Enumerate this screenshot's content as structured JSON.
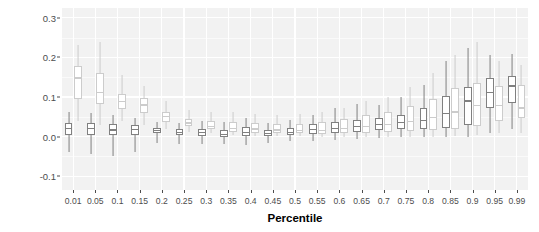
{
  "chart_data": {
    "type": "box",
    "title": "",
    "xlabel": "Percentile",
    "ylabel": "Pseudo R-Square",
    "ylim": [
      -0.135,
      0.325
    ],
    "yticks": [
      -0.1,
      0.0,
      0.1,
      0.2,
      0.3
    ],
    "ytick_labels": [
      "-0.1",
      "0.0",
      "0.1",
      "0.2",
      "0.3"
    ],
    "grid": true,
    "legend": "none",
    "categories": [
      "0.01",
      "0.05",
      "0.1",
      "0.15",
      "0.2",
      "0.25",
      "0.3",
      "0.35",
      "0.4",
      "0.45",
      "0.5",
      "0.55",
      "0.6",
      "0.65",
      "0.7",
      "0.75",
      "0.8",
      "0.85",
      "0.9",
      "0.95",
      "0.99"
    ],
    "series": [
      {
        "name": "group-a",
        "color_fill": "#ffffff",
        "color_line": "#808080",
        "boxes": [
          {
            "category": "0.01",
            "min": -0.04,
            "q1": 0.005,
            "median": 0.02,
            "q3": 0.035,
            "max": 0.063
          },
          {
            "category": "0.05",
            "min": -0.045,
            "q1": 0.004,
            "median": 0.02,
            "q3": 0.034,
            "max": 0.06
          },
          {
            "category": "0.1",
            "min": -0.048,
            "q1": 0.003,
            "median": 0.017,
            "q3": 0.031,
            "max": 0.055
          },
          {
            "category": "0.15",
            "min": -0.04,
            "q1": 0.004,
            "median": 0.018,
            "q3": 0.03,
            "max": 0.048
          },
          {
            "category": "0.2",
            "min": -0.015,
            "q1": 0.008,
            "median": 0.015,
            "q3": 0.021,
            "max": 0.038
          },
          {
            "category": "0.25",
            "min": -0.02,
            "q1": 0.004,
            "median": 0.01,
            "q3": 0.018,
            "max": 0.035
          },
          {
            "category": "0.3",
            "min": -0.018,
            "q1": 0.002,
            "median": 0.01,
            "q3": 0.02,
            "max": 0.04
          },
          {
            "category": "0.35",
            "min": -0.02,
            "q1": 0.0,
            "median": 0.006,
            "q3": 0.017,
            "max": 0.037
          },
          {
            "category": "0.4",
            "min": -0.022,
            "q1": 0.002,
            "median": 0.011,
            "q3": 0.024,
            "max": 0.048
          },
          {
            "category": "0.45",
            "min": -0.015,
            "q1": 0.002,
            "median": 0.008,
            "q3": 0.016,
            "max": 0.035
          },
          {
            "category": "0.5",
            "min": -0.012,
            "q1": 0.003,
            "median": 0.011,
            "q3": 0.022,
            "max": 0.043
          },
          {
            "category": "0.55",
            "min": -0.01,
            "q1": 0.006,
            "median": 0.018,
            "q3": 0.031,
            "max": 0.055
          },
          {
            "category": "0.6",
            "min": -0.008,
            "q1": 0.008,
            "median": 0.02,
            "q3": 0.038,
            "max": 0.072
          },
          {
            "category": "0.65",
            "min": -0.006,
            "q1": 0.011,
            "median": 0.026,
            "q3": 0.042,
            "max": 0.082
          },
          {
            "category": "0.7",
            "min": -0.003,
            "q1": 0.016,
            "median": 0.031,
            "q3": 0.046,
            "max": 0.08
          },
          {
            "category": "0.75",
            "min": -0.002,
            "q1": 0.018,
            "median": 0.035,
            "q3": 0.055,
            "max": 0.1
          },
          {
            "category": "0.8",
            "min": 0.0,
            "q1": 0.02,
            "median": 0.04,
            "q3": 0.072,
            "max": 0.13
          },
          {
            "category": "0.85",
            "min": 0.0,
            "q1": 0.022,
            "median": 0.058,
            "q3": 0.102,
            "max": 0.19
          },
          {
            "category": "0.9",
            "min": 0.0,
            "q1": 0.03,
            "median": 0.09,
            "q3": 0.125,
            "max": 0.225
          },
          {
            "category": "0.95",
            "min": 0.01,
            "q1": 0.072,
            "median": 0.112,
            "q3": 0.148,
            "max": 0.205
          },
          {
            "category": "0.99",
            "min": 0.02,
            "q1": 0.085,
            "median": 0.128,
            "q3": 0.152,
            "max": 0.208
          }
        ]
      },
      {
        "name": "group-b",
        "color_fill": "#ffffff",
        "color_line": "#cccccc",
        "boxes": [
          {
            "category": "0.01",
            "min": 0.04,
            "q1": 0.095,
            "median": 0.148,
            "q3": 0.178,
            "max": 0.232
          },
          {
            "category": "0.05",
            "min": 0.03,
            "q1": 0.082,
            "median": 0.112,
            "q3": 0.16,
            "max": 0.238
          },
          {
            "category": "0.1",
            "min": 0.04,
            "q1": 0.07,
            "median": 0.088,
            "q3": 0.108,
            "max": 0.155
          },
          {
            "category": "0.15",
            "min": 0.03,
            "q1": 0.06,
            "median": 0.08,
            "q3": 0.098,
            "max": 0.128
          },
          {
            "category": "0.2",
            "min": 0.018,
            "q1": 0.036,
            "median": 0.05,
            "q3": 0.062,
            "max": 0.09
          },
          {
            "category": "0.25",
            "min": 0.012,
            "q1": 0.026,
            "median": 0.034,
            "q3": 0.044,
            "max": 0.068
          },
          {
            "category": "0.3",
            "min": 0.008,
            "q1": 0.018,
            "median": 0.026,
            "q3": 0.04,
            "max": 0.062
          },
          {
            "category": "0.35",
            "min": 0.004,
            "q1": 0.012,
            "median": 0.021,
            "q3": 0.036,
            "max": 0.062
          },
          {
            "category": "0.4",
            "min": 0.002,
            "q1": 0.01,
            "median": 0.019,
            "q3": 0.034,
            "max": 0.058
          },
          {
            "category": "0.45",
            "min": 0.002,
            "q1": 0.009,
            "median": 0.017,
            "q3": 0.032,
            "max": 0.054
          },
          {
            "category": "0.5",
            "min": 0.001,
            "q1": 0.008,
            "median": 0.016,
            "q3": 0.033,
            "max": 0.056
          },
          {
            "category": "0.55",
            "min": 0.0,
            "q1": 0.007,
            "median": 0.016,
            "q3": 0.038,
            "max": 0.062
          },
          {
            "category": "0.6",
            "min": 0.0,
            "q1": 0.008,
            "median": 0.02,
            "q3": 0.044,
            "max": 0.072
          },
          {
            "category": "0.65",
            "min": 0.0,
            "q1": 0.01,
            "median": 0.026,
            "q3": 0.055,
            "max": 0.09
          },
          {
            "category": "0.7",
            "min": 0.0,
            "q1": 0.012,
            "median": 0.03,
            "q3": 0.062,
            "max": 0.1
          },
          {
            "category": "0.75",
            "min": 0.0,
            "q1": 0.014,
            "median": 0.038,
            "q3": 0.078,
            "max": 0.125
          },
          {
            "category": "0.8",
            "min": 0.0,
            "q1": 0.016,
            "median": 0.048,
            "q3": 0.095,
            "max": 0.16
          },
          {
            "category": "0.85",
            "min": 0.002,
            "q1": 0.02,
            "median": 0.062,
            "q3": 0.122,
            "max": 0.205
          },
          {
            "category": "0.9",
            "min": 0.005,
            "q1": 0.028,
            "median": 0.078,
            "q3": 0.135,
            "max": 0.24
          },
          {
            "category": "0.95",
            "min": 0.008,
            "q1": 0.04,
            "median": 0.078,
            "q3": 0.128,
            "max": 0.19
          },
          {
            "category": "0.99",
            "min": 0.01,
            "q1": 0.048,
            "median": 0.072,
            "q3": 0.13,
            "max": 0.18
          }
        ]
      }
    ]
  },
  "style": {
    "panel_bg": "#f2f2f2",
    "grid_color": "#ffffff",
    "tick_text_color": "#4d4d4d",
    "axis_title_color": "#000000",
    "figure_bg": "#ffffff"
  }
}
